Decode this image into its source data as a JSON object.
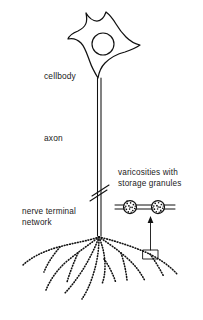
{
  "figure": {
    "type": "biological-diagram",
    "background_color": "#ffffff",
    "ink_color": "#111111",
    "width": 203,
    "height": 320
  },
  "labels": {
    "cellbody": "cellbody",
    "axon": "axon",
    "nerve_terminal_network_line1": "nerve terminal",
    "nerve_terminal_network_line2": "network",
    "varicosities_line1": "varicosities with",
    "varicosities_line2": "storage granules"
  },
  "parts": {
    "soma": {
      "name": "cellbody",
      "shape": "stellate",
      "center_x": 101,
      "center_y": 48,
      "nucleus": {
        "center_x": 103,
        "center_y": 44,
        "radius": 11
      }
    },
    "axon": {
      "name": "axon",
      "top_y": 78,
      "bottom_y": 236,
      "x": 99,
      "style": "double-line",
      "break_marks": 2,
      "break_y": 193
    },
    "terminal_network": {
      "name": "nerve terminal network",
      "origin_x": 99,
      "origin_y": 236,
      "branch_count": 9,
      "branch_style": "beaded-dotted"
    },
    "callout": {
      "name": "varicosity magnification callout",
      "box_x": 143,
      "box_y": 250,
      "box_width": 15,
      "box_height": 9,
      "arrow_from_y": 250,
      "arrow_to_y": 218
    },
    "inset": {
      "name": "varicosity detail",
      "varicosity_count": 2,
      "circle_radius": 6.5,
      "circle1_x": 130,
      "circle2_x": 158,
      "circle_y": 207,
      "granules_per_varicosity": 16
    }
  }
}
